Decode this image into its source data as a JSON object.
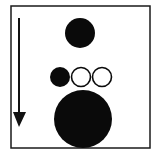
{
  "diagram": {
    "frame": {
      "x": 11,
      "y": 6,
      "width": 139,
      "height": 142,
      "stroke": "#1a1a1a",
      "stroke_width": 1.5
    },
    "arrow": {
      "x": 19,
      "y1": 18,
      "y2": 114,
      "head": {
        "left": 13,
        "right": 26,
        "top": 112,
        "tip": 127
      },
      "color": "#111111",
      "direction": "down"
    },
    "circles": [
      {
        "id": "top-filled",
        "cx": 80,
        "cy": 33,
        "r": 15,
        "filled": true
      },
      {
        "id": "small-filled",
        "cx": 60,
        "cy": 77,
        "r": 10,
        "filled": true
      },
      {
        "id": "small-open-1",
        "cx": 81,
        "cy": 77,
        "r": 9.5,
        "filled": false
      },
      {
        "id": "small-open-2",
        "cx": 102,
        "cy": 77,
        "r": 9.5,
        "filled": false
      },
      {
        "id": "large-filled",
        "cx": 83,
        "cy": 119,
        "r": 29,
        "filled": true
      }
    ],
    "colors": {
      "fill": "#0a0a0a",
      "background": "#ffffff"
    }
  }
}
